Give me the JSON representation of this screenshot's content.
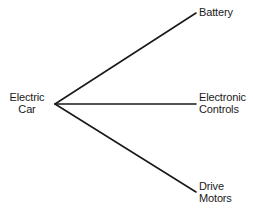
{
  "diagram": {
    "type": "fan-tree",
    "background_color": "#ffffff",
    "line_color": "#1a1a1a",
    "text_color": "#1a1a1a",
    "line_width": 1.6,
    "vertex": {
      "x": 55,
      "y": 104
    },
    "root": {
      "id": "electric-car",
      "lines": [
        "Electric",
        "Car"
      ]
    },
    "leaves": [
      {
        "id": "battery",
        "lines": [
          "Battery"
        ],
        "endpoint": {
          "x": 196,
          "y": 13
        }
      },
      {
        "id": "electronic-controls",
        "lines": [
          "Electronic",
          "Controls"
        ],
        "endpoint": {
          "x": 196,
          "y": 104
        }
      },
      {
        "id": "drive-motors",
        "lines": [
          "Drive",
          "Motors"
        ],
        "endpoint": {
          "x": 196,
          "y": 192
        }
      }
    ]
  }
}
